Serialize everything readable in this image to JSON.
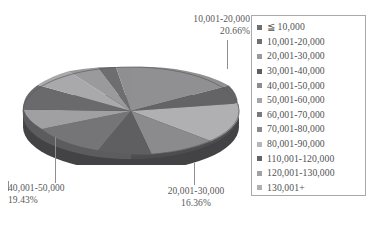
{
  "chart_data": {
    "type": "pie",
    "title": "",
    "three_d": true,
    "grid": false,
    "legend_position": "right",
    "categories": [
      "≦ 10,000",
      "10,001-20,000",
      "20,001-30,000",
      "30,001-40,000",
      "40,001-50,000",
      "50,001-60,000",
      "60,001-70,000",
      "70,001-80,000",
      "80,001-90,000",
      "110,001-120,000",
      "120,001-130,000",
      "130,001+"
    ],
    "values": [
      5.2,
      20.66,
      16.36,
      8.4,
      19.43,
      9.1,
      6.3,
      5.4,
      3.6,
      2.5,
      1.7,
      1.35
    ],
    "value_unit": "%",
    "colors": [
      "#6f6f71",
      "#8f8f91",
      "#a8a8aa",
      "#5f5f61",
      "#9b9b9d",
      "#787a7c",
      "#8a8a8c",
      "#707072",
      "#b4b4b6",
      "#666668",
      "#9f9fa1",
      "#7c7c7e"
    ],
    "annotations": [
      {
        "name": "10,001-20,000",
        "percent": "20.66%",
        "position": "top-right"
      },
      {
        "name": "40,001-50,000",
        "percent": "19.43%",
        "position": "bottom-left"
      },
      {
        "name": "20,001-30,000",
        "percent": "16.36%",
        "position": "bottom-center"
      }
    ]
  },
  "callouts": {
    "top": {
      "label": "10,001-20,000",
      "percent": "20.66%"
    },
    "bottom_left": {
      "label": "40,001-50,000",
      "percent": "19.43%"
    },
    "bottom_center": {
      "label": "20,001-30,000",
      "percent": "16.36%"
    }
  },
  "legend": {
    "items": [
      {
        "label": "≦ 10,000",
        "color": "#6f6f71"
      },
      {
        "label": "10,001-20,000",
        "color": "#707072"
      },
      {
        "label": "20,001-30,000",
        "color": "#9a9a9c"
      },
      {
        "label": "30,001-40,000",
        "color": "#5e5e60"
      },
      {
        "label": "40,001-50,000",
        "color": "#8d8d8f"
      },
      {
        "label": "50,001-60,000",
        "color": "#a6a6a8"
      },
      {
        "label": "60,001-70,000",
        "color": "#7a7a7c"
      },
      {
        "label": "70,001-80,000",
        "color": "#8a8a8c"
      },
      {
        "label": "80,001-90,000",
        "color": "#b7b7b9"
      },
      {
        "label": "110,001-120,000",
        "color": "#646466"
      },
      {
        "label": "120,001-130,000",
        "color": "#a2a2a4"
      },
      {
        "label": "130,001+",
        "color": "#b0b0b2"
      }
    ]
  },
  "colors": {
    "text": "#58585a",
    "legend_border": "#a9a9ab",
    "leader_line": "#8e8e90",
    "background": "#ffffff"
  }
}
